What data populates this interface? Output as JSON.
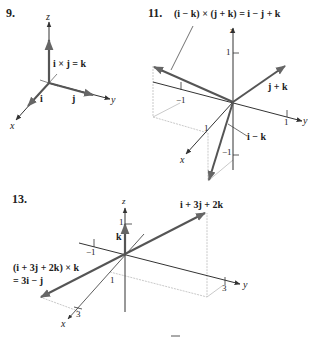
{
  "figures": [
    {
      "number": "9.",
      "axes": {
        "x": "x",
        "y": "y",
        "z": "z"
      },
      "vectors": [
        {
          "name": "i",
          "label": "i"
        },
        {
          "name": "j",
          "label": "j"
        },
        {
          "name": "k",
          "label": "i × j = k"
        }
      ]
    },
    {
      "number": "11.",
      "equation": "(i − k) × (j + k) = i − j + k",
      "axes": {
        "x": "x",
        "y": "y",
        "z": "z"
      },
      "ticks": {
        "z_pos": "1",
        "z_neg": "−1",
        "y_pos": "1",
        "y_neg": "−1",
        "x_pos": "1"
      },
      "vectors": [
        {
          "name": "j+k",
          "label": "j + k"
        },
        {
          "name": "i-k",
          "label": "i − k"
        },
        {
          "name": "i-j+k",
          "label": ""
        }
      ]
    },
    {
      "number": "13.",
      "axes": {
        "x": "x",
        "y": "y",
        "z": "z"
      },
      "ticks": {
        "z_pos": "1",
        "y_neg": "−1",
        "x_pos": "1",
        "x_3": "3",
        "y_3": "3"
      },
      "vectors": [
        {
          "name": "k",
          "label": "k"
        },
        {
          "name": "i+3j+2k",
          "label": "i + 3j + 2k"
        },
        {
          "name": "cross",
          "label_line1": "(i + 3j + 2k) × k",
          "label_line2": "= 3i − j"
        }
      ]
    }
  ],
  "colors": {
    "axis": "#333333",
    "vector": "#555555",
    "guide": "#bbbbbb"
  }
}
